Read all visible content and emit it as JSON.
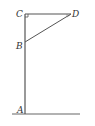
{
  "diagram": {
    "type": "geometry",
    "points": {
      "A": {
        "label": "A",
        "x": 25,
        "y": 114
      },
      "B": {
        "label": "B",
        "x": 25,
        "y": 42
      },
      "C": {
        "label": "C",
        "x": 25,
        "y": 14
      },
      "D": {
        "label": "D",
        "x": 71,
        "y": 14
      }
    },
    "segments": [
      {
        "from": "A",
        "to": "C"
      },
      {
        "from": "C",
        "to": "D"
      },
      {
        "from": "B",
        "to": "D"
      }
    ],
    "ground_line": {
      "x1": 12,
      "x2": 80,
      "y": 114
    },
    "right_angle_at": "C",
    "colors": {
      "line": "#555555",
      "text": "#333333"
    }
  }
}
